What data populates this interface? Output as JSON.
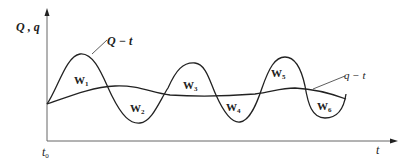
{
  "diagram": {
    "axes": {
      "y_label": "Q , q",
      "x_label": "t",
      "origin_label": "t",
      "origin_subscript": "0"
    },
    "curves": [
      {
        "name": "Q-t",
        "label": "Q − t",
        "description": "oscillating inflow curve"
      },
      {
        "name": "q-t",
        "label": "q − t",
        "description": "smooth outflow curve"
      }
    ],
    "regions": [
      {
        "label": "W",
        "sub": "1"
      },
      {
        "label": "W",
        "sub": "2"
      },
      {
        "label": "W",
        "sub": "3"
      },
      {
        "label": "W",
        "sub": "4"
      },
      {
        "label": "W",
        "sub": "5"
      },
      {
        "label": "W",
        "sub": "6"
      }
    ],
    "colors": {
      "line": "#222222",
      "axis": "#555555",
      "background": "#ffffff"
    }
  }
}
